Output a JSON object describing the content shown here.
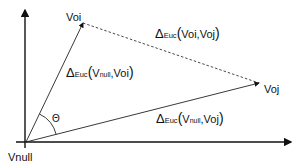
{
  "diagram": {
    "points": {
      "origin": {
        "label": "Vnull",
        "x": 26,
        "y": 142
      },
      "oi": {
        "label": "Voi",
        "x": 83,
        "y": 23
      },
      "oj": {
        "label": "Voj",
        "x": 259,
        "y": 83
      }
    },
    "angle_label": "Θ",
    "labels": {
      "d_oi_oj": {
        "delta": "Δ",
        "sub": "Euc",
        "open": "(",
        "a": "Voi",
        "sep": ", ",
        "b": "Voj",
        "close": ")"
      },
      "d_null_oi": {
        "delta": "Δ",
        "sub": "Euc",
        "open": "(",
        "a_main": "V",
        "a_sub": "null",
        "sep": ", ",
        "b": "Voi",
        "close": ")"
      },
      "d_null_oj": {
        "delta": "Δ",
        "sub": "Euc",
        "open": "(",
        "a_main": "V",
        "a_sub": "null",
        "sep": ", ",
        "b": "Voj",
        "close": ")"
      }
    },
    "colors": {
      "line": "#111111",
      "dashed": "#333333",
      "background": "#ffffff"
    }
  }
}
